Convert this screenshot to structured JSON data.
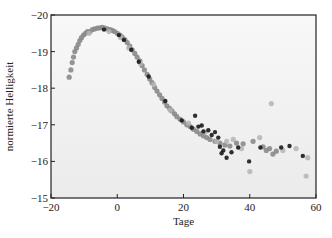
{
  "chart_data": {
    "type": "scatter",
    "title": "",
    "xlabel": "Tage",
    "ylabel": "normierte Helligkeit",
    "xlim": [
      -20,
      60
    ],
    "ylim": [
      -20,
      -15
    ],
    "y_inverted": true,
    "grid": false,
    "xticks": [
      -20,
      0,
      20,
      40,
      60
    ],
    "xtick_labels": [
      "−20",
      "0",
      "20",
      "40",
      "60"
    ],
    "yticks": [
      -20,
      -19,
      -18,
      -17,
      -16,
      -15
    ],
    "ytick_labels": [
      "−20",
      "−19",
      "−18",
      "−17",
      "−16",
      "−15"
    ],
    "colors": {
      "background_top": "#f7f7f7",
      "background_bottom": "#ececec",
      "gray_point": "#8a8a8a",
      "light_point": "#b4b4b4",
      "dark_point": "#1a1a1a",
      "frame": "#222222"
    },
    "series": [
      {
        "name": "gray",
        "points": [
          [
            -14.5,
            -18.3
          ],
          [
            -14.0,
            -18.5
          ],
          [
            -13.6,
            -18.7
          ],
          [
            -13.2,
            -18.85
          ],
          [
            -12.8,
            -19.0
          ],
          [
            -12.3,
            -19.1
          ],
          [
            -11.8,
            -19.2
          ],
          [
            -11.3,
            -19.3
          ],
          [
            -10.8,
            -19.38
          ],
          [
            -10.2,
            -19.45
          ],
          [
            -9.6,
            -19.5
          ],
          [
            -9.0,
            -19.55
          ],
          [
            -8.2,
            -19.55
          ],
          [
            -7.5,
            -19.6
          ],
          [
            -6.8,
            -19.62
          ],
          [
            -6.0,
            -19.64
          ],
          [
            -5.2,
            -19.65
          ],
          [
            -4.5,
            -19.66
          ],
          [
            -3.8,
            -19.64
          ],
          [
            -3.0,
            -19.62
          ],
          [
            -2.2,
            -19.6
          ],
          [
            -1.5,
            -19.58
          ],
          [
            -0.8,
            -19.55
          ],
          [
            0.0,
            -19.5
          ],
          [
            0.8,
            -19.45
          ],
          [
            1.5,
            -19.4
          ],
          [
            2.3,
            -19.33
          ],
          [
            3.0,
            -19.25
          ],
          [
            3.8,
            -19.15
          ],
          [
            4.5,
            -19.05
          ],
          [
            5.3,
            -18.95
          ],
          [
            6.0,
            -18.85
          ],
          [
            6.8,
            -18.75
          ],
          [
            7.5,
            -18.62
          ],
          [
            8.2,
            -18.5
          ],
          [
            9.0,
            -18.38
          ],
          [
            9.8,
            -18.25
          ],
          [
            10.5,
            -18.15
          ],
          [
            11.3,
            -18.02
          ],
          [
            12.0,
            -17.92
          ],
          [
            12.8,
            -17.82
          ],
          [
            13.5,
            -17.72
          ],
          [
            14.3,
            -17.62
          ],
          [
            15.0,
            -17.52
          ],
          [
            15.8,
            -17.45
          ],
          [
            16.5,
            -17.38
          ],
          [
            17.3,
            -17.3
          ],
          [
            18.0,
            -17.22
          ],
          [
            19.0,
            -17.15
          ],
          [
            20.0,
            -17.08
          ],
          [
            21.0,
            -17.0
          ],
          [
            22.0,
            -16.95
          ],
          [
            23.0,
            -16.88
          ],
          [
            24.0,
            -16.82
          ],
          [
            25.0,
            -16.75
          ],
          [
            26.0,
            -16.7
          ],
          [
            27.0,
            -16.65
          ],
          [
            28.0,
            -16.6
          ],
          [
            29.5,
            -16.55
          ],
          [
            31.0,
            -16.5
          ],
          [
            32.5,
            -16.45
          ],
          [
            34.0,
            -16.42
          ],
          [
            36.0,
            -16.5
          ],
          [
            38.0,
            -16.48
          ],
          [
            41.0,
            -16.55
          ],
          [
            44.0,
            -16.4
          ],
          [
            45.0,
            -16.3
          ],
          [
            46.0,
            -16.35
          ],
          [
            47.0,
            -16.2
          ],
          [
            48.0,
            -16.28
          ]
        ]
      },
      {
        "name": "light",
        "points": [
          [
            -8.5,
            -19.5
          ],
          [
            -2.5,
            -19.55
          ],
          [
            1.0,
            -19.38
          ],
          [
            3.5,
            -19.1
          ],
          [
            7.0,
            -18.68
          ],
          [
            11.0,
            -18.1
          ],
          [
            16.0,
            -17.4
          ],
          [
            21.5,
            -17.05
          ],
          [
            26.5,
            -16.8
          ],
          [
            30.0,
            -16.55
          ],
          [
            33.0,
            -16.55
          ],
          [
            35.0,
            -16.6
          ],
          [
            40.0,
            -15.72
          ],
          [
            46.5,
            -17.58
          ],
          [
            50.0,
            -16.3
          ],
          [
            54.0,
            -16.35
          ],
          [
            57.5,
            -16.1
          ],
          [
            57.0,
            -15.6
          ],
          [
            43.0,
            -16.65
          ],
          [
            37.5,
            -16.35
          ]
        ]
      },
      {
        "name": "dark",
        "points": [
          [
            -4.0,
            -19.6
          ],
          [
            0.5,
            -19.45
          ],
          [
            2.0,
            -19.32
          ],
          [
            4.2,
            -19.05
          ],
          [
            6.5,
            -18.72
          ],
          [
            9.5,
            -18.32
          ],
          [
            14.5,
            -17.65
          ],
          [
            19.5,
            -17.12
          ],
          [
            22.5,
            -16.92
          ],
          [
            23.5,
            -17.25
          ],
          [
            25.5,
            -16.98
          ],
          [
            27.5,
            -16.85
          ],
          [
            28.5,
            -16.72
          ],
          [
            29.5,
            -16.8
          ],
          [
            30.5,
            -16.65
          ],
          [
            31.0,
            -16.4
          ],
          [
            31.5,
            -16.22
          ],
          [
            32.0,
            -16.3
          ],
          [
            33.0,
            -16.1
          ],
          [
            34.5,
            -16.25
          ],
          [
            36.5,
            -16.38
          ],
          [
            39.8,
            -16.0
          ],
          [
            43.2,
            -16.38
          ],
          [
            49.5,
            -16.38
          ],
          [
            52.0,
            -16.42
          ],
          [
            56.0,
            -16.15
          ],
          [
            24.5,
            -16.95
          ],
          [
            26.0,
            -16.82
          ]
        ]
      }
    ]
  }
}
